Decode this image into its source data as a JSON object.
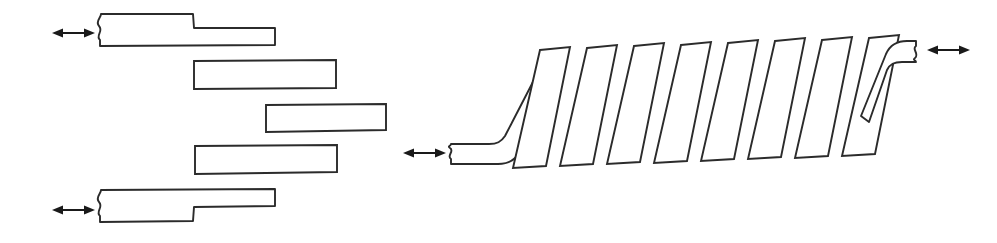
{
  "figure": {
    "background_color": "#ffffff",
    "line_color": "#2b2b2b",
    "arrow_color": "#1a1a1a",
    "width": 997,
    "height": 243,
    "text_labels": [],
    "left_assembly": {
      "name": "stepped-lap-stack",
      "element_count": 5,
      "description": "Five horizontal overlapping bars arranged in a descending-then-ascending staircase offset pattern",
      "elements": [
        {
          "index": 1,
          "name": "stepped-bar-top",
          "type": "stepped-bar",
          "has_break_symbol": true,
          "break_side": "left",
          "step_side": "bottom-right-thin",
          "x": 95,
          "y": 13,
          "width": 180,
          "height": 33
        },
        {
          "index": 2,
          "name": "plain-bar-second",
          "type": "plain-bar",
          "has_break_symbol": false,
          "x": 193,
          "y": 60,
          "width": 143,
          "height": 29
        },
        {
          "index": 3,
          "name": "plain-bar-third",
          "type": "plain-bar",
          "has_break_symbol": false,
          "x": 265,
          "y": 104,
          "width": 120,
          "height": 28
        },
        {
          "index": 4,
          "name": "plain-bar-fourth",
          "type": "plain-bar",
          "has_break_symbol": false,
          "x": 194,
          "y": 145,
          "width": 143,
          "height": 29
        },
        {
          "index": 5,
          "name": "stepped-bar-bottom",
          "type": "stepped-bar",
          "has_break_symbol": true,
          "break_side": "left",
          "step_side": "bottom-left-thick",
          "x": 95,
          "y": 189,
          "width": 180,
          "height": 33
        }
      ]
    },
    "right_assembly": {
      "name": "cascaded-shear-stack",
      "tilted_element_count": 8,
      "description": "Eight parallel tilted bars leaning to the right, flanked by two bent end members with break symbols",
      "tilt_direction": "right-leaning",
      "tilt_angle_degrees": 18,
      "end_members": [
        {
          "name": "bent-end-left",
          "position": "left",
          "has_break_symbol": true,
          "break_side": "left",
          "bend": "horizontal-to-diagonal"
        },
        {
          "name": "bent-end-right",
          "position": "right",
          "has_break_symbol": true,
          "break_side": "right",
          "bend": "diagonal-to-horizontal"
        }
      ],
      "tilted_bars": [
        {
          "index": 1,
          "name": "tilted-bar-1",
          "bottom_x": 512
        },
        {
          "index": 2,
          "name": "tilted-bar-2",
          "bottom_x": 559
        },
        {
          "index": 3,
          "name": "tilted-bar-3",
          "bottom_x": 606
        },
        {
          "index": 4,
          "name": "tilted-bar-4",
          "bottom_x": 653
        },
        {
          "index": 5,
          "name": "tilted-bar-5",
          "bottom_x": 700
        },
        {
          "index": 6,
          "name": "tilted-bar-6",
          "bottom_x": 747
        },
        {
          "index": 7,
          "name": "tilted-bar-7",
          "bottom_x": 794
        },
        {
          "index": 8,
          "name": "tilted-bar-8",
          "bottom_x": 841
        }
      ]
    },
    "arrows": [
      {
        "name": "load-arrow-top-left",
        "style": "double-headed",
        "orientation": "horizontal",
        "x1": 52,
        "x2": 95,
        "y": 33
      },
      {
        "name": "load-arrow-bottom-left",
        "style": "double-headed",
        "orientation": "horizontal",
        "x1": 52,
        "x2": 95,
        "y": 210
      },
      {
        "name": "load-arrow-middle-left",
        "style": "double-headed",
        "orientation": "horizontal",
        "x1": 403,
        "x2": 446,
        "y": 153
      },
      {
        "name": "load-arrow-right",
        "style": "double-headed",
        "orientation": "horizontal",
        "x1": 927,
        "x2": 970,
        "y": 50
      }
    ]
  }
}
